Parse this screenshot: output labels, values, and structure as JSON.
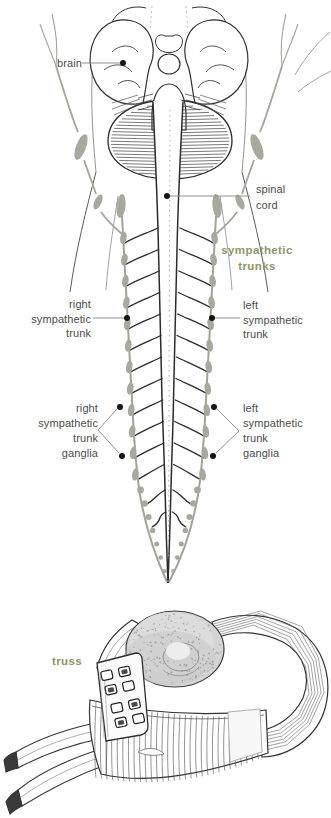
{
  "palette": {
    "label_text": "#4b4b4b",
    "keyword_green": "#8e9568",
    "ganglion_gray": "#a6aa9c",
    "trunk_gray": "#9fa399",
    "ink": "#2e2e2e",
    "leader_line": "#8f8f8f",
    "leader_dot": "#151515",
    "background": "#ffffff"
  },
  "figure_trunks": {
    "description": "anatomical drawing of brain, spinal cord and sympathetic trunks",
    "labels": {
      "brain": {
        "text": "brain"
      },
      "spinal_cord": {
        "line1": "spinal",
        "line2": "cord"
      },
      "sympathetic_trunks": {
        "line1": "sympathetic",
        "line2": "trunks"
      },
      "right_trunk": {
        "line1": "right",
        "line2": "sympathetic",
        "line3": "trunk"
      },
      "left_trunk": {
        "line1": "left",
        "line2": "sympathetic",
        "line3": "trunk"
      },
      "right_ganglia": {
        "line1": "right",
        "line2": "sympathetic",
        "line3": "trunk",
        "line4": "ganglia"
      },
      "left_ganglia": {
        "line1": "left",
        "line2": "sympathetic",
        "line3": "trunk",
        "line4": "ganglia"
      }
    }
  },
  "figure_truss": {
    "description": "drawing of a hernia truss belt with pad, buckle and straps",
    "labels": {
      "truss": {
        "text": "truss"
      }
    }
  }
}
